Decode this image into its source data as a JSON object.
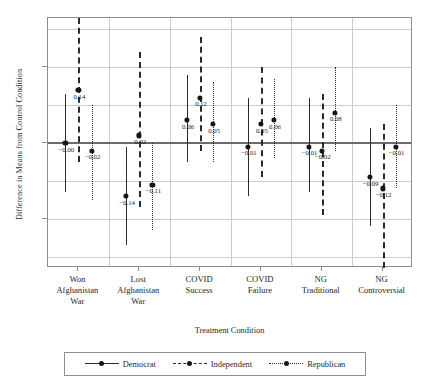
{
  "chart_data": {
    "type": "scatter",
    "title": "",
    "xlabel": "Treatment Condition",
    "ylabel": "Difference in Means from Control Condition",
    "ylim": [
      -0.33,
      0.33
    ],
    "yticks": [
      0.2,
      0.0,
      -0.2
    ],
    "ytick_labels": [
      "0.2",
      "0.0",
      "-0.2"
    ],
    "grid": true,
    "legend_position": "bottom",
    "categories": [
      "Won Afghanistan War",
      "Lost Afghanistan War",
      "COVID Success",
      "COVID Failure",
      "NG Traditional",
      "NG Controversial"
    ],
    "category_lines": [
      [
        "Won",
        "Afghanistan",
        "War"
      ],
      [
        "Lost",
        "Afghanistan",
        "War"
      ],
      [
        "COVID",
        "Success",
        ""
      ],
      [
        "COVID",
        "Failure",
        ""
      ],
      [
        "NG",
        "Traditional",
        ""
      ],
      [
        "NG",
        "Controversial",
        ""
      ]
    ],
    "series": [
      {
        "name": "Democrat",
        "style": "solid",
        "values": [
          -0.0,
          -0.14,
          0.06,
          -0.01,
          -0.01,
          -0.09
        ],
        "labels": [
          "-0.00",
          "-0.14",
          "0.06",
          "-0.01",
          "-0.01",
          "-0.09"
        ],
        "ci_low": [
          -0.13,
          -0.27,
          -0.05,
          -0.14,
          -0.13,
          -0.22
        ],
        "ci_high": [
          0.13,
          -0.01,
          0.18,
          0.12,
          0.12,
          0.04
        ]
      },
      {
        "name": "Independent",
        "style": "dashed",
        "values": [
          0.14,
          0.02,
          0.12,
          0.05,
          -0.02,
          -0.12
        ],
        "labels": [
          "0.14",
          "0.02",
          "0.12",
          "0.05",
          "-0.02",
          "-0.12"
        ],
        "ci_low": [
          -0.05,
          -0.17,
          -0.02,
          -0.09,
          -0.19,
          -0.33
        ],
        "ci_high": [
          0.36,
          0.24,
          0.28,
          0.2,
          0.13,
          0.05
        ]
      },
      {
        "name": "Republican",
        "style": "dotted",
        "values": [
          -0.02,
          -0.11,
          0.05,
          0.06,
          0.08,
          -0.01
        ],
        "labels": [
          "-0.02",
          "-0.11",
          "0.05",
          "0.06",
          "0.08",
          "-0.01"
        ],
        "ci_low": [
          -0.15,
          -0.23,
          -0.05,
          -0.04,
          -0.02,
          -0.12
        ],
        "ci_high": [
          0.1,
          0.0,
          0.16,
          0.17,
          0.2,
          0.1
        ]
      }
    ]
  },
  "legend": {
    "items": [
      {
        "label": "Democrat",
        "style": "democrat"
      },
      {
        "label": "Independent",
        "style": "independent"
      },
      {
        "label": "Republican",
        "style": "republican"
      }
    ]
  }
}
